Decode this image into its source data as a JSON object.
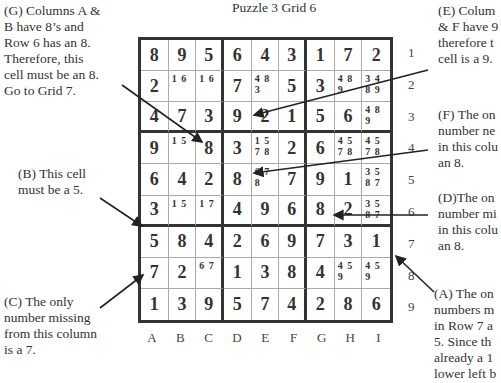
{
  "title": "Puzzle 3  Grid 6",
  "notes": {
    "G": "(G) Columns A &\nB have 8’s and\nRow 6 has an 8.\nTherefore, this\ncell must be an 8.\nGo to Grid 7.",
    "B": "(B) This cell\nmust be a 5.",
    "C": "(C) The only\nnumber missing\nfrom this column\nis a 7.",
    "E": "(E) Colum\n& F have 9\ntherefore t\ncell is a 9.",
    "F": "(F) The on\nnumber ne\nin this colu\nan 8.",
    "D": "(D)The on\nnumber mi\nin this colu\nan 8.",
    "A": "(A) The on\nnumbers m\nin Row 7 a\n5. Since th\nalready a 1\nlower left b"
  },
  "column_labels": [
    "A",
    "B",
    "C",
    "D",
    "E",
    "F",
    "G",
    "H",
    "I"
  ],
  "row_labels": [
    "1",
    "2",
    "3",
    "4",
    "5",
    "6",
    "7",
    "8",
    "9"
  ],
  "grid": [
    [
      {
        "v": "8"
      },
      {
        "v": "9"
      },
      {
        "v": "5"
      },
      {
        "v": "6"
      },
      {
        "v": "4"
      },
      {
        "v": "3"
      },
      {
        "v": "1"
      },
      {
        "v": "7"
      },
      {
        "v": "2"
      }
    ],
    [
      {
        "v": "2"
      },
      {
        "p": "1 6"
      },
      {
        "p": "1 6"
      },
      {
        "v": "7"
      },
      {
        "p": "4 8\n3"
      },
      {
        "v": "5"
      },
      {
        "v": "3"
      },
      {
        "p": "4 8\n9"
      },
      {
        "p": "3 4\n8 9"
      }
    ],
    [
      {
        "v": "4"
      },
      {
        "v": "7"
      },
      {
        "v": "3"
      },
      {
        "v": "9"
      },
      {
        "v": "2"
      },
      {
        "v": "1"
      },
      {
        "v": "5"
      },
      {
        "v": "6"
      },
      {
        "p": "4 8\n9"
      }
    ],
    [
      {
        "v": "9"
      },
      {
        "p": "1 5"
      },
      {
        "v": "8"
      },
      {
        "v": "3"
      },
      {
        "p": "1 5\n7 8"
      },
      {
        "v": "2"
      },
      {
        "v": "6"
      },
      {
        "p": "4 5\n7 8"
      },
      {
        "p": "4 5\n7 8"
      }
    ],
    [
      {
        "v": "6"
      },
      {
        "v": "4"
      },
      {
        "v": "2"
      },
      {
        "v": "8"
      },
      {
        "p": "6 7\n8"
      },
      {
        "v": "7"
      },
      {
        "v": "9"
      },
      {
        "v": "1"
      },
      {
        "p": "3 5\n8 7"
      }
    ],
    [
      {
        "v": "3"
      },
      {
        "p": "1 5"
      },
      {
        "p": "1 7"
      },
      {
        "v": "4"
      },
      {
        "v": "9"
      },
      {
        "v": "6"
      },
      {
        "v": "8"
      },
      {
        "v": "2"
      },
      {
        "p": "3 5\n8 7"
      }
    ],
    [
      {
        "v": "5"
      },
      {
        "v": "8"
      },
      {
        "v": "4"
      },
      {
        "v": "2"
      },
      {
        "v": "6"
      },
      {
        "v": "9"
      },
      {
        "v": "7"
      },
      {
        "v": "3"
      },
      {
        "v": "1"
      }
    ],
    [
      {
        "v": "7"
      },
      {
        "v": "2"
      },
      {
        "p": "6 7"
      },
      {
        "v": "1"
      },
      {
        "v": "3"
      },
      {
        "v": "8"
      },
      {
        "v": "4"
      },
      {
        "p": "4 5\n9"
      },
      {
        "p": "4 5\n9"
      }
    ],
    [
      {
        "v": "1"
      },
      {
        "v": "3"
      },
      {
        "v": "9"
      },
      {
        "v": "5"
      },
      {
        "v": "7"
      },
      {
        "v": "4"
      },
      {
        "v": "2"
      },
      {
        "v": "8"
      },
      {
        "v": "6"
      }
    ]
  ],
  "colors": {
    "grid_line": "#333333",
    "thin_line": "#aaaaaa",
    "text": "#333333"
  }
}
